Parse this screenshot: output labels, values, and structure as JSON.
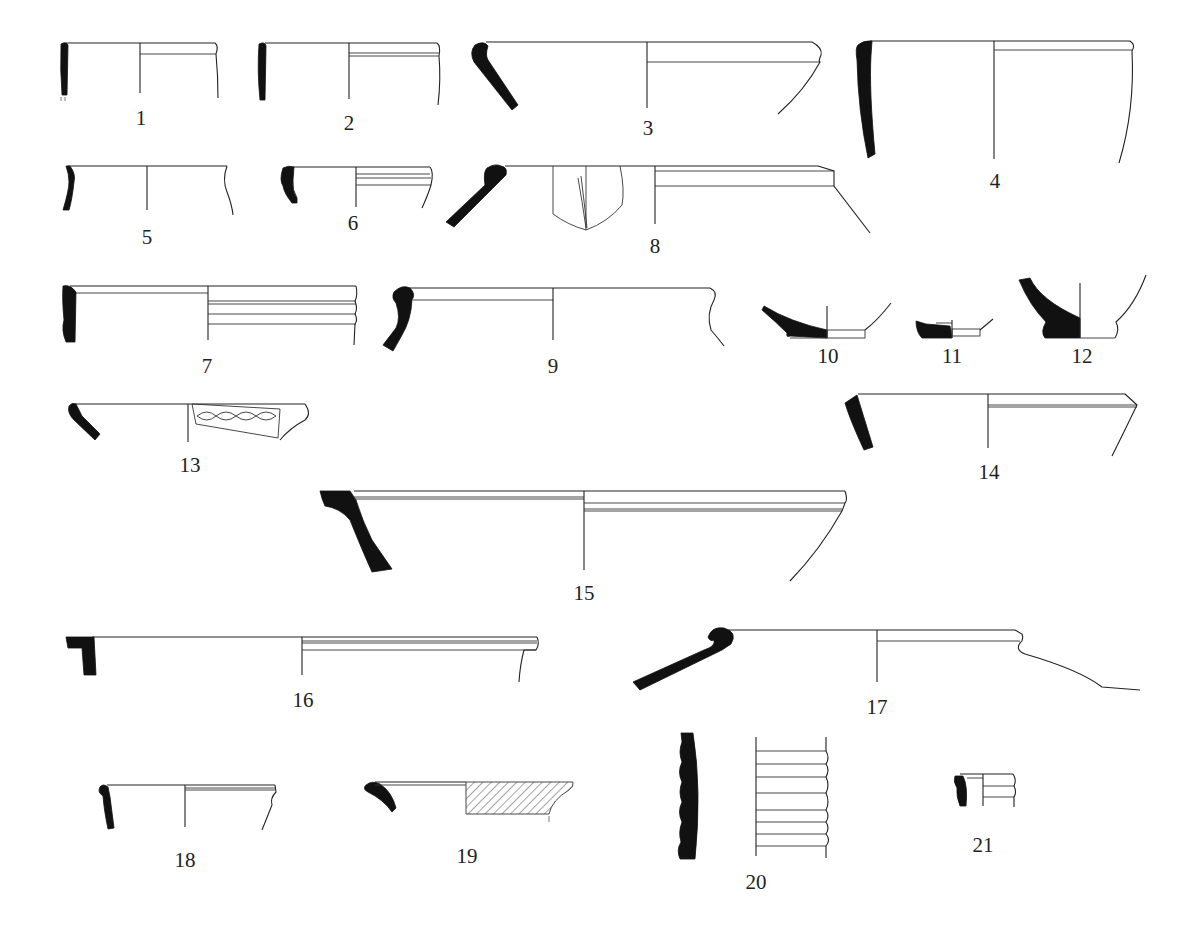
{
  "plate": {
    "background": "#ffffff",
    "ink_color": "#111111",
    "figures": [
      {
        "number": "1",
        "label_x": 141,
        "label_y": 108,
        "type": "rim"
      },
      {
        "number": "2",
        "label_x": 349,
        "label_y": 113,
        "type": "rim"
      },
      {
        "number": "3",
        "label_x": 648,
        "label_y": 118,
        "type": "rim"
      },
      {
        "number": "4",
        "label_x": 995,
        "label_y": 171,
        "type": "rim"
      },
      {
        "number": "5",
        "label_x": 147,
        "label_y": 227,
        "type": "rim"
      },
      {
        "number": "6",
        "label_x": 353,
        "label_y": 213,
        "type": "rim"
      },
      {
        "number": "8",
        "label_x": 655,
        "label_y": 236,
        "type": "rim",
        "note": "with applied handle/lug view"
      },
      {
        "number": "7",
        "label_x": 207,
        "label_y": 356,
        "type": "rim"
      },
      {
        "number": "9",
        "label_x": 553,
        "label_y": 356,
        "type": "rim"
      },
      {
        "number": "10",
        "label_x": 828,
        "label_y": 357,
        "type": "base"
      },
      {
        "number": "11",
        "label_x": 952,
        "label_y": 357,
        "type": "base"
      },
      {
        "number": "12",
        "label_x": 1082,
        "label_y": 357,
        "type": "base"
      },
      {
        "number": "13",
        "label_x": 190,
        "label_y": 460,
        "type": "rim",
        "note": "wavy incised decoration"
      },
      {
        "number": "14",
        "label_x": 989,
        "label_y": 464,
        "type": "rim"
      },
      {
        "number": "15",
        "label_x": 584,
        "label_y": 586,
        "type": "rim"
      },
      {
        "number": "16",
        "label_x": 303,
        "label_y": 692,
        "type": "rim"
      },
      {
        "number": "17",
        "label_x": 877,
        "label_y": 698,
        "type": "rim"
      },
      {
        "number": "18",
        "label_x": 185,
        "label_y": 851,
        "type": "rim"
      },
      {
        "number": "19",
        "label_x": 467,
        "label_y": 847,
        "type": "rim",
        "note": "hatched exterior"
      },
      {
        "number": "20",
        "label_x": 756,
        "label_y": 873,
        "type": "body sherd",
        "note": "ribbed"
      },
      {
        "number": "21",
        "label_x": 983,
        "label_y": 837,
        "type": "rim"
      }
    ]
  }
}
